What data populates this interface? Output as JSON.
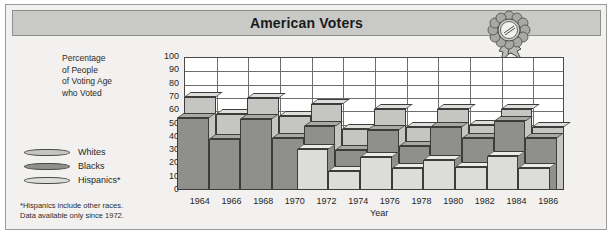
{
  "header": {
    "title": "American Voters",
    "badge_icon": "award-rosette-icon"
  },
  "axis_caption": {
    "line1": "Percentage",
    "line2": "of People",
    "line3": "of Voting Age",
    "line4": "who Voted"
  },
  "legend": {
    "items": [
      {
        "label": "Whites",
        "color": "#c5c5c2"
      },
      {
        "label": "Blacks",
        "color": "#8f8f8c"
      },
      {
        "label": "Hispanics*",
        "color": "#dcdcd8"
      }
    ]
  },
  "footnote": {
    "line1": "*Hispanics include other races.",
    "line2": "Data available only since 1972."
  },
  "colors": {
    "page_background": "#ffffff",
    "card_background": "#f2f1ef",
    "title_background": "#c9c9c7",
    "plot_background": "#ffffff",
    "grid": "#6e6e6e",
    "outline": "#3c3c3c",
    "whites": "#c5c5c2",
    "whites_top": "#dedeDB",
    "whites_side": "#a9a9a6",
    "blacks": "#8f8f8c",
    "blacks_top": "#a8a8a4",
    "blacks_side": "#76766f",
    "hispanics": "#dcdcd8",
    "hispanics_top": "#ebebe7",
    "hispanics_side": "#bfbfba"
  },
  "chart_data": {
    "type": "bar",
    "title": "American Voters",
    "xlabel": "Year",
    "ylabel": "Percentage of People of Voting Age who Voted",
    "ylim": [
      0,
      100
    ],
    "ytick_step": 10,
    "yticks": [
      0,
      10,
      20,
      30,
      40,
      50,
      60,
      70,
      80,
      90,
      100
    ],
    "grid": true,
    "legend_position": "left",
    "categories": [
      "1964",
      "1966",
      "1968",
      "1970",
      "1972",
      "1974",
      "1976",
      "1978",
      "1980",
      "1982",
      "1984",
      "1986"
    ],
    "series": [
      {
        "name": "Whites",
        "values": [
          70,
          57,
          69,
          56,
          65,
          46,
          61,
          47,
          61,
          49,
          61,
          47
        ]
      },
      {
        "name": "Blacks",
        "values": [
          58,
          42,
          57,
          43,
          52,
          34,
          49,
          37,
          51,
          43,
          56,
          43
        ]
      },
      {
        "name": "Hispanics*",
        "values": [
          null,
          null,
          null,
          null,
          38,
          22,
          32,
          24,
          30,
          25,
          33,
          24
        ]
      }
    ],
    "annotations": [
      "*Hispanics include other races.",
      "Data available only since 1972."
    ]
  }
}
